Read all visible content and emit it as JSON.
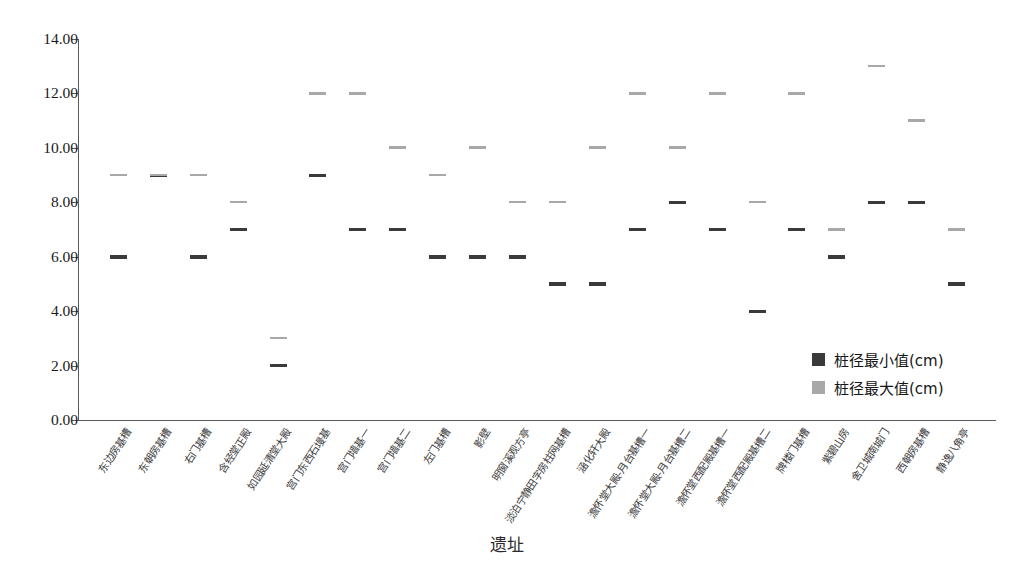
{
  "chart_data": {
    "type": "scatter",
    "title": "",
    "xlabel": "遗址",
    "ylabel": "",
    "ylim": [
      0,
      14
    ],
    "ytick_step": 2,
    "ytick_labels": [
      "14.00",
      "12.00",
      "10.00",
      "8.00",
      "6.00",
      "4.00",
      "2.00",
      "0.00"
    ],
    "ytick_values": [
      14,
      12,
      10,
      8,
      6,
      4,
      2,
      0
    ],
    "grid": false,
    "legend_position": "inside-bottom-right",
    "marker_style": "horizontal-dash",
    "categories": [
      "东边房基槽",
      "东朝房基槽",
      "右门基槽",
      "含经堂正殿",
      "如园延清堂大殿",
      "宫门东西石墁基",
      "宫门墙基一",
      "宫门墙基二",
      "左门基槽",
      "影壁",
      "明窗溪观方亭",
      "淡泊宁静田字房柱网基槽",
      "涵化轩大殿",
      "澹怀堂大殿-月台基槽一",
      "澹怀堂大殿-月台基槽二",
      "澹怀堂西配殿基槽一",
      "澹怀堂西配殿基槽二",
      "牌楼门基槽",
      "紫碧山房",
      "舍卫城南城门",
      "西朝房基槽",
      "静逸八角亭"
    ],
    "series": [
      {
        "name": "桩径最小值(cm)",
        "color": "#3a3a3a",
        "values": [
          6,
          9,
          6,
          7,
          2,
          9,
          7,
          7,
          6,
          6,
          6,
          5,
          5,
          7,
          8,
          7,
          4,
          7,
          6,
          8,
          8,
          5
        ]
      },
      {
        "name": "桩径最大值(cm)",
        "color": "#a8a8a8",
        "values": [
          9,
          9,
          9,
          8,
          3,
          12,
          12,
          10,
          9,
          10,
          8,
          8,
          10,
          12,
          10,
          12,
          8,
          12,
          7,
          13,
          11,
          7
        ]
      }
    ]
  },
  "legend": {
    "items": [
      {
        "label": "桩径最小值(cm)",
        "color": "#3a3a3a"
      },
      {
        "label": "桩径最大值(cm)",
        "color": "#a8a8a8"
      }
    ]
  },
  "axis": {
    "x_title": "遗址"
  }
}
